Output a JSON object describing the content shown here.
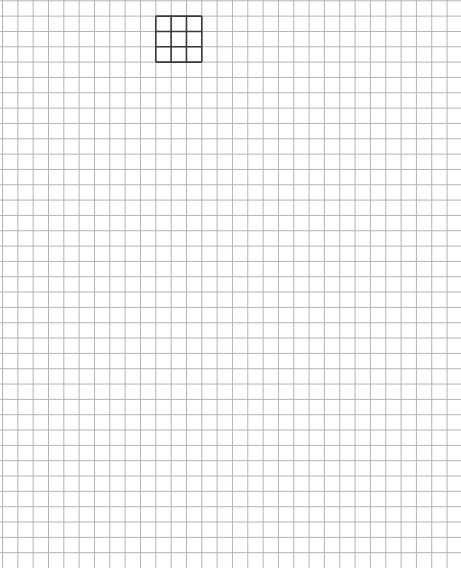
{
  "canvas": {
    "width": 461,
    "height": 568,
    "background": "#ffffff"
  },
  "grid": {
    "cell_size": 15.33,
    "offset_x": 2.5,
    "offset_y": 0.8,
    "line_color": "#b4b4b4",
    "line_width": 1
  },
  "highlight_box": {
    "start_col": 10,
    "start_row": 1,
    "cols": 3,
    "rows": 3,
    "line_color": "#3a3a3a",
    "line_width": 1.6
  }
}
